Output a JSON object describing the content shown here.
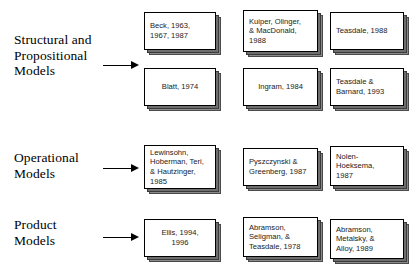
{
  "diagram": {
    "type": "grouped-reference-diagram",
    "colors": {
      "box_fill": "#ffffff",
      "box_border": "#000000",
      "shadow_mid": "#6e6e6e",
      "shadow_back": "#8a8a8a",
      "text": "#000000",
      "background": "#ffffff"
    },
    "groups": [
      {
        "id": "structural-propositional",
        "label": "Structural and\nPropositional\nModels",
        "arrow": "arrow-right",
        "rows": [
          [
            {
              "id": "beck",
              "text": "Beck, 1963,\n1967, 1987",
              "align": "left"
            },
            {
              "id": "kuiper-olinger-macdonald",
              "text": "Kuiper, Olinger,\n& MacDonald,\n1988",
              "align": "left"
            },
            {
              "id": "teasdale-1988",
              "text": "Teasdale, 1988",
              "align": "left"
            }
          ],
          [
            {
              "id": "blatt",
              "text": "Blatt, 1974",
              "align": "center"
            },
            {
              "id": "ingram",
              "text": "Ingram, 1984",
              "align": "center"
            },
            {
              "id": "teasdale-barnard",
              "text": "Teasdale &\nBarnard, 1993",
              "align": "left"
            }
          ]
        ]
      },
      {
        "id": "operational",
        "label": "Operational\nModels",
        "arrow": "arrow-right",
        "rows": [
          [
            {
              "id": "lewinsohn",
              "text": "Lewinsohn,\nHoberman, Teri,\n& Hautzinger,\n1985",
              "align": "left"
            },
            {
              "id": "pyszczynski-greenberg",
              "text": "Pyszczynski &\nGreenberg, 1987",
              "align": "left"
            },
            {
              "id": "nolen-hoeksema",
              "text": "Nolen-\nHoeksema,\n1987",
              "align": "left"
            }
          ]
        ]
      },
      {
        "id": "product",
        "label": "Product\nModels",
        "arrow": "arrow-right",
        "rows": [
          [
            {
              "id": "ellis",
              "text": "Ellis, 1994,\n1996",
              "align": "center"
            },
            {
              "id": "abramson-seligman-teasdale",
              "text": "Abramson,\nSeligman, &\nTeasdale, 1978",
              "align": "left"
            },
            {
              "id": "abramson-metalsky-alloy",
              "text": "Abramson,\nMetalsky, &\nAlloy, 1989",
              "align": "left"
            }
          ]
        ]
      }
    ]
  }
}
